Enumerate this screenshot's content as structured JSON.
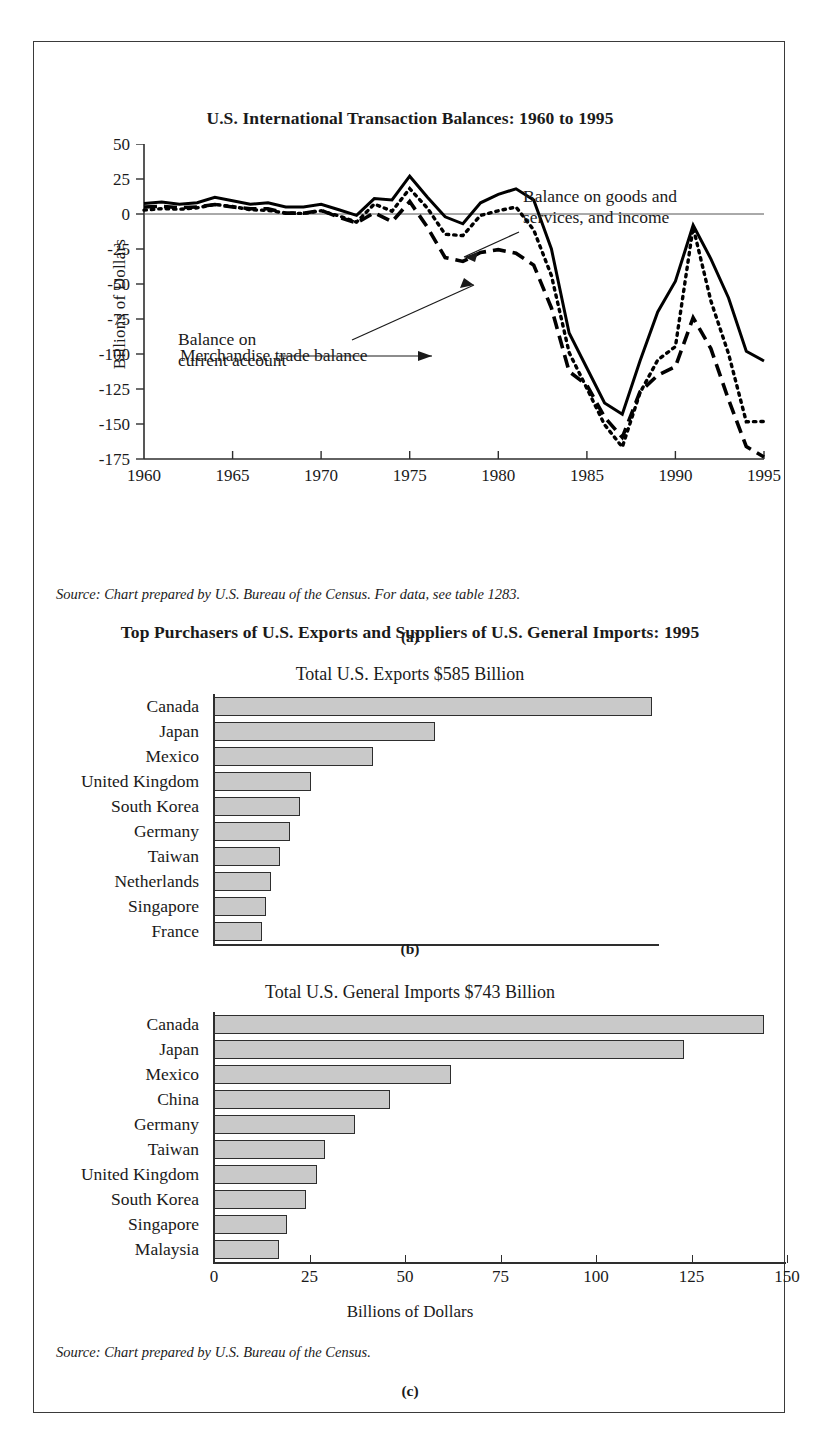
{
  "figure": {
    "panel_a_caption": "(a)",
    "panel_b_caption": "(b)",
    "panel_c_caption": "(c)",
    "source_a": "Source: Chart prepared by U.S. Bureau of the Census. For data, see table 1283.",
    "source_c": "Source: Chart prepared by U.S. Bureau of the Census."
  },
  "chart_data": [
    {
      "type": "line",
      "title": "U.S. International Transaction Balances: 1960 to 1995",
      "xlabel": "",
      "ylabel": "Billions of Dollars",
      "xlim": [
        1960,
        1995
      ],
      "ylim": [
        -175,
        50
      ],
      "xticks": [
        "1960",
        "1965",
        "1970",
        "1975",
        "1980",
        "1985",
        "1990",
        "1995"
      ],
      "yticks": [
        "50",
        "25",
        "0",
        "-25",
        "-50",
        "-75",
        "-100",
        "-125",
        "-150",
        "-175"
      ],
      "grid": false,
      "legend_position": "annotations",
      "annotations": [
        "Balance on goods and\nservices, and income",
        "Balance on\ncurrent account",
        "Merchandise trade balance"
      ],
      "annotation_1_line1": "Balance on goods and",
      "annotation_1_line2": "services, and income",
      "annotation_2_line1": "Balance on",
      "annotation_2_line2": "current account",
      "annotation_3": "Merchandise trade balance",
      "x": [
        1960,
        1961,
        1962,
        1963,
        1964,
        1965,
        1966,
        1967,
        1968,
        1969,
        1970,
        1971,
        1972,
        1973,
        1974,
        1975,
        1976,
        1977,
        1978,
        1979,
        1980,
        1981,
        1982,
        1983,
        1984,
        1985,
        1986,
        1987,
        1988,
        1989,
        1990,
        1991,
        1992,
        1993,
        1994,
        1995
      ],
      "series": [
        {
          "name": "Balance on goods and services, and income",
          "style": "solid",
          "values": [
            7.5,
            8.5,
            7.0,
            8.0,
            12.0,
            9.5,
            7.0,
            8.0,
            5.0,
            5.0,
            7.0,
            3.0,
            -1.0,
            11.0,
            10.0,
            27.0,
            12.0,
            -2.0,
            -7.0,
            8.0,
            14.0,
            18.0,
            10.0,
            -25.0,
            -85.0,
            -110.0,
            -135.0,
            -143.0,
            -105.0,
            -70.0,
            -48.0,
            -8.0,
            -32.0,
            -60.0,
            -98.0,
            -105.0,
            -122.0
          ]
        },
        {
          "name": "Merchandise trade balance",
          "style": "dashed",
          "values": [
            5.0,
            5.5,
            4.5,
            5.0,
            6.8,
            5.0,
            3.8,
            3.8,
            0.6,
            0.6,
            2.6,
            -2.3,
            -6.4,
            0.9,
            -5.5,
            8.9,
            -9.5,
            -31.1,
            -33.9,
            -27.5,
            -25.5,
            -28.0,
            -36.5,
            -67.1,
            -112.5,
            -122.2,
            -145.1,
            -159.6,
            -127.0,
            -115.2,
            -109.0,
            -74.1,
            -96.1,
            -132.6,
            -166.1,
            -173.6
          ]
        },
        {
          "name": "Balance on current account",
          "style": "dotted",
          "values": [
            2.8,
            3.8,
            3.4,
            4.4,
            6.8,
            5.4,
            3.0,
            2.6,
            0.6,
            0.4,
            2.3,
            -1.4,
            -5.8,
            7.1,
            2.0,
            18.1,
            4.2,
            -14.5,
            -15.4,
            -1.0,
            2.3,
            5.0,
            -11.4,
            -44.0,
            -99.0,
            -124.5,
            -150.5,
            -166.5,
            -127.7,
            -104.3,
            -94.7,
            -9.5,
            -62.0,
            -99.9,
            -148.4,
            -148.2
          ]
        }
      ]
    },
    {
      "type": "bar",
      "orientation": "horizontal",
      "title": "Top Purchasers of U.S. Exports and Suppliers of U.S. General Imports: 1995",
      "subtitle": "Total U.S. Exports $585 Billion",
      "xlabel": "",
      "ylabel": "",
      "xlim": [
        0,
        150
      ],
      "grid": false,
      "categories": [
        "Canada",
        "Japan",
        "Mexico",
        "United Kingdom",
        "South Korea",
        "Germany",
        "Taiwan",
        "Netherlands",
        "Singapore",
        "France"
      ],
      "values": [
        127,
        64,
        46,
        28,
        25,
        22,
        19,
        16.5,
        15,
        14
      ]
    },
    {
      "type": "bar",
      "orientation": "horizontal",
      "title": "",
      "subtitle": "Total U.S. General Imports $743 Billion",
      "xlabel": "Billions of Dollars",
      "ylabel": "",
      "xlim": [
        0,
        150
      ],
      "xticks": [
        "0",
        "25",
        "50",
        "75",
        "100",
        "125",
        "150"
      ],
      "grid": false,
      "categories": [
        "Canada",
        "Japan",
        "Mexico",
        "China",
        "Germany",
        "Taiwan",
        "United Kingdom",
        "South Korea",
        "Singapore",
        "Malaysia"
      ],
      "values": [
        144,
        123,
        62,
        46,
        37,
        29,
        27,
        24,
        19,
        17
      ]
    }
  ],
  "colors": {
    "bar_fill": "#c9c9c9",
    "bar_border": "#2e2e2e",
    "line": "#000000",
    "frame": "#3a3a3a"
  }
}
